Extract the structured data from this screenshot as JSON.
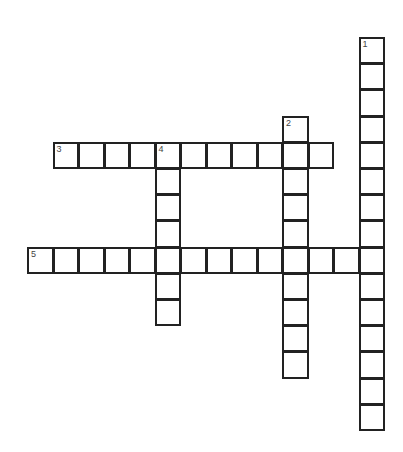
{
  "puzzle": {
    "type": "crossword",
    "origin_x": 28,
    "origin_y": 38,
    "cell_w": 25.5,
    "cell_h": 26.2,
    "entries": [
      {
        "number": "1",
        "direction": "down",
        "row": 0,
        "col": 13,
        "length": 15
      },
      {
        "number": "2",
        "direction": "down",
        "row": 3,
        "col": 10,
        "length": 10
      },
      {
        "number": "3",
        "direction": "across",
        "row": 4,
        "col": 1,
        "length": 11
      },
      {
        "number": "4",
        "direction": "down",
        "row": 4,
        "col": 5,
        "length": 7
      },
      {
        "number": "5",
        "direction": "across",
        "row": 8,
        "col": 0,
        "length": 14
      }
    ],
    "colors": {
      "border": "#222222",
      "background": "#ffffff",
      "number": "#444444"
    }
  }
}
